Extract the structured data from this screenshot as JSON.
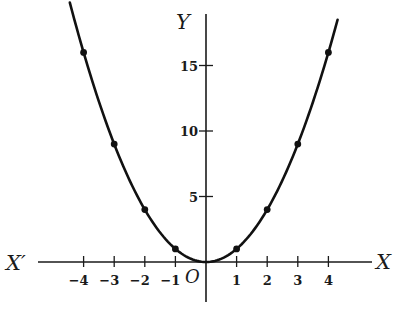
{
  "chart_data": {
    "type": "line",
    "title": "",
    "equation": "y = x^2",
    "xlabel": "X",
    "xlabel_negative": "X′",
    "ylabel": "Y",
    "origin_label": "O",
    "x": [
      -4,
      -3,
      -2,
      -1,
      0,
      1,
      2,
      3,
      4
    ],
    "series": [
      {
        "name": "y = x²",
        "values": [
          16,
          9,
          4,
          1,
          0,
          1,
          4,
          9,
          16
        ],
        "markers": true
      }
    ],
    "x_ticks": [
      -4,
      -3,
      -2,
      -1,
      1,
      2,
      3,
      4
    ],
    "x_tick_labels": [
      "−4",
      "−3",
      "−2",
      "−1",
      "1",
      "2",
      "3",
      "4"
    ],
    "y_ticks": [
      5,
      10,
      15
    ],
    "y_tick_labels": [
      "5",
      "10",
      "15"
    ],
    "xlim": [
      -6.5,
      5.4
    ],
    "ylim": [
      -3,
      19
    ],
    "grid": false,
    "legend": "none"
  },
  "layout": {
    "origin_px": [
      206,
      262
    ],
    "x_scale_px": 30.6,
    "y_scale_px": 13.1,
    "x_axis_px": [
      38,
      372
    ],
    "y_axis_px": [
      14,
      302
    ],
    "curve_x_range": [
      -4.45,
      4.3
    ]
  }
}
